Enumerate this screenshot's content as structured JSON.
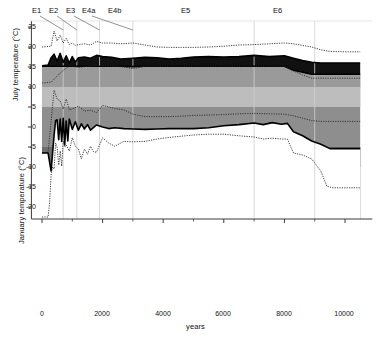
{
  "chart_data": {
    "type": "area",
    "title": "",
    "xlabel": "years",
    "ylabel_top": "July temperature (°C)",
    "ylabel_bottom": "January temperature (°C)",
    "xlim": [
      -350,
      10900
    ],
    "ylim": [
      -23,
      26.5
    ],
    "xticks": [
      0,
      2000,
      4000,
      6000,
      8000,
      10000
    ],
    "xticklabels": [
      "0",
      "2000",
      "4000",
      "6000",
      "8000",
      "10000"
    ],
    "xminorticks": [
      1000,
      3000,
      5000,
      7000,
      9000
    ],
    "yticks": [
      25,
      20,
      15,
      10,
      5,
      0,
      -5,
      -10,
      -15,
      -20
    ],
    "yticklabels": [
      "25",
      "20",
      "15",
      "10",
      "5",
      "0",
      "-5",
      "-10",
      "-15",
      "-20"
    ],
    "grid": "vertical-event-lines",
    "legend": "none",
    "event_markers": [
      {
        "label": "E1",
        "x": 700,
        "label_x": 35,
        "label_y": 8
      },
      {
        "label": "E2",
        "x": 1150,
        "label_x": 52,
        "label_y": 8
      },
      {
        "label": "E3",
        "x": 1900,
        "label_x": 68,
        "label_y": 8
      },
      {
        "label": "E4a",
        "x": 3000,
        "label_x": 83,
        "label_y": 8
      },
      {
        "label": "E4b",
        "x": 3000,
        "label_x": 108,
        "label_y": 8
      },
      {
        "label": "E5",
        "x": 7000,
        "label_x": 182,
        "label_y": 8
      },
      {
        "label": "E6",
        "x": 9000,
        "label_x": 274,
        "label_y": 8
      }
    ],
    "event_gridlines_x": [
      700,
      1150,
      1900,
      3000,
      7000,
      9000
    ],
    "series": [
      {
        "name": "july-max-dotted",
        "style": "dotted",
        "x": [
          0,
          150,
          300,
          400,
          500,
          600,
          700,
          800,
          900,
          1000,
          1100,
          1200,
          1400,
          1600,
          1800,
          2000,
          2300,
          2600,
          3000,
          3400,
          3800,
          4200,
          4600,
          5000,
          5500,
          6000,
          6500,
          7000,
          7500,
          8000,
          8300,
          8600,
          8900,
          9200,
          9500,
          10000,
          10500
        ],
        "values": [
          20.0,
          20.1,
          20.2,
          24.0,
          21.5,
          23.0,
          21.0,
          22.2,
          20.6,
          21.0,
          20.4,
          20.6,
          20.8,
          20.5,
          21.4,
          21.0,
          21.0,
          20.8,
          21.0,
          20.5,
          20.0,
          19.9,
          19.9,
          19.9,
          20.0,
          20.2,
          20.5,
          20.6,
          20.8,
          21.0,
          20.8,
          20.4,
          20.0,
          19.3,
          18.9,
          18.8,
          18.8
        ]
      },
      {
        "name": "july-upper-solid-black-band-top",
        "style": "solid",
        "x": [
          0,
          200,
          300,
          400,
          500,
          600,
          700,
          800,
          900,
          1000,
          1100,
          1200,
          1400,
          1600,
          1800,
          2000,
          2300,
          2600,
          3000,
          3400,
          3800,
          4200,
          4600,
          5000,
          5500,
          6000,
          6500,
          7000,
          7500,
          8000,
          8300,
          8600,
          8900,
          9200,
          9500,
          10000,
          10500
        ],
        "values": [
          15.3,
          15.5,
          17.3,
          18.2,
          16.5,
          18.4,
          16.2,
          17.8,
          16.0,
          17.6,
          16.2,
          17.3,
          17.5,
          17.2,
          17.9,
          17.6,
          17.4,
          17.0,
          17.2,
          17.4,
          17.3,
          17.0,
          17.2,
          17.5,
          17.6,
          17.5,
          17.6,
          17.9,
          17.6,
          17.8,
          17.2,
          16.6,
          16.2,
          16.0,
          16.0,
          16.0,
          16.0
        ]
      },
      {
        "name": "july-lower-solid-black-band-bottom",
        "style": "solid",
        "x": [
          0,
          200,
          300,
          400,
          600,
          800,
          1000,
          1200,
          1400,
          1600,
          1800,
          2000,
          2300,
          2600,
          3000,
          3400,
          3800,
          4200,
          4600,
          5000,
          5500,
          6000,
          6500,
          7000,
          7500,
          8000,
          8300,
          8600,
          8900,
          9200,
          9500,
          10000,
          10500
        ],
        "values": [
          15.2,
          15.2,
          15.2,
          15.2,
          15.2,
          15.2,
          15.2,
          15.2,
          15.2,
          15.2,
          15.2,
          15.2,
          15.2,
          15.2,
          15.1,
          15.2,
          15.2,
          15.2,
          15.2,
          15.2,
          15.2,
          15.2,
          15.2,
          15.2,
          15.2,
          15.2,
          14.2,
          13.7,
          13.2,
          13.2,
          13.2,
          13.2,
          13.2
        ]
      },
      {
        "name": "july-band-mid-dotted-lower",
        "style": "dotted",
        "x": [
          0,
          300,
          600,
          900,
          1200,
          1500,
          1800,
          2100,
          2400,
          2700,
          3000,
          3400,
          3800,
          4200,
          4600,
          5000,
          5500,
          6000,
          6500,
          7000,
          7500,
          8000,
          8300,
          8600,
          8900,
          9200,
          9500,
          10000,
          10500
        ],
        "values": [
          11.0,
          11.2,
          13.5,
          15.3,
          14.9,
          15.2,
          15.4,
          15.3,
          15.2,
          15.0,
          14.6,
          15.2,
          15.2,
          15.2,
          15.2,
          15.2,
          15.2,
          15.2,
          15.2,
          15.2,
          15.2,
          15.2,
          14.0,
          13.0,
          12.2,
          12.2,
          12.2,
          12.2,
          12.2
        ]
      },
      {
        "name": "jan-upper-dotted",
        "style": "dotted",
        "x": [
          0,
          200,
          400,
          500,
          600,
          700,
          800,
          900,
          1000,
          1200,
          1400,
          1600,
          1800,
          2000,
          2200,
          2400,
          2700,
          3000,
          3400,
          3800,
          4200,
          4600,
          5000,
          5500,
          6000,
          6500,
          7000,
          7500,
          8000,
          8300,
          8600,
          8900,
          9200,
          9500,
          10000,
          10500
        ],
        "values": [
          -6.5,
          -6.3,
          9.2,
          7.0,
          6.5,
          4.5,
          7.0,
          4.3,
          4.5,
          5.2,
          4.0,
          4.2,
          3.6,
          5.4,
          5.0,
          4.6,
          4.3,
          3.2,
          2.6,
          2.6,
          2.6,
          2.7,
          2.9,
          3.0,
          3.1,
          3.3,
          3.4,
          3.3,
          3.2,
          2.8,
          2.2,
          1.6,
          1.4,
          1.4,
          1.4,
          1.4
        ]
      },
      {
        "name": "jan-band-top-solid",
        "style": "solid",
        "x": [
          0,
          200,
          300,
          400,
          450,
          500,
          550,
          600,
          650,
          700,
          750,
          800,
          850,
          900,
          1000,
          1100,
          1200,
          1300,
          1400,
          1500,
          1600,
          1800,
          2000,
          2200,
          2400,
          2700,
          3000,
          3400,
          3800,
          4200,
          4600,
          5000,
          5500,
          6000,
          6500,
          7000,
          7300,
          7600,
          7900,
          8100,
          8300,
          8600,
          8900,
          9200,
          9500,
          10000,
          10500
        ],
        "values": [
          -6.5,
          -6.5,
          -11.0,
          -2.0,
          1.6,
          1.8,
          -3.2,
          2.0,
          -3.6,
          2.2,
          -4.5,
          1.5,
          -3.5,
          2.0,
          -0.6,
          1.3,
          -0.8,
          0.8,
          -0.5,
          0.6,
          -0.8,
          0.5,
          0.0,
          -0.4,
          -0.2,
          -0.4,
          -0.5,
          -0.6,
          -0.5,
          -0.4,
          -0.4,
          -0.4,
          -0.2,
          0.3,
          0.6,
          1.0,
          0.6,
          1.1,
          0.7,
          0.9,
          -1.2,
          -2.2,
          -3.5,
          -4.3,
          -5.4,
          -5.4,
          -5.4
        ]
      },
      {
        "name": "jan-lower-dotted",
        "style": "dotted",
        "x": [
          0,
          100,
          150,
          200,
          250,
          300,
          350,
          400,
          450,
          500,
          550,
          600,
          650,
          700,
          750,
          800,
          900,
          1000,
          1100,
          1200,
          1300,
          1400,
          1500,
          1600,
          1700,
          1800,
          1900,
          2000,
          2200,
          2400,
          2700,
          3000,
          3400,
          3800,
          4200,
          4600,
          5000,
          5500,
          6000,
          6500,
          7000,
          7300,
          7600,
          7900,
          8100,
          8300,
          8600,
          8900,
          9200,
          9400,
          9600,
          10000,
          10500
        ],
        "values": [
          -22.5,
          -22.5,
          -22.5,
          -22.5,
          -19.0,
          -12.0,
          -10.0,
          -10.5,
          -4.0,
          -5.0,
          -9.5,
          -6.0,
          -9.8,
          -3.5,
          -5.0,
          -4.5,
          -6.0,
          -2.7,
          -4.8,
          -5.5,
          -8.0,
          -5.5,
          -6.8,
          -4.8,
          -6.2,
          -6.3,
          -4.5,
          -2.7,
          -4.0,
          -4.8,
          -3.6,
          -3.7,
          -3.6,
          -3.0,
          -2.6,
          -2.3,
          -2.0,
          -1.8,
          -1.8,
          -2.2,
          -2.5,
          -3.0,
          -2.8,
          -3.0,
          -3.0,
          -6.5,
          -7.0,
          -8.0,
          -11.0,
          -14.8,
          -15.2,
          -15.2,
          -15.2
        ]
      }
    ],
    "bands": [
      {
        "name": "july-black-band",
        "color": "#111111"
      },
      {
        "name": "july-upper-mid-gray",
        "color": "#9a9a9a"
      },
      {
        "name": "july-light-gray",
        "color": "#bdbdbd"
      },
      {
        "name": "july-lower-mid-gray",
        "color": "#8e8e8e"
      },
      {
        "name": "jan-dark-gray",
        "color": "#6e6e6e"
      },
      {
        "name": "jan-darker-gray",
        "color": "#555555"
      }
    ],
    "colors": {
      "axis": "#3a3a3a",
      "gridline": "#cfcfcf",
      "text": "#111111",
      "dotted_line": "#2a2a2a",
      "solid_line": "#000000"
    }
  }
}
